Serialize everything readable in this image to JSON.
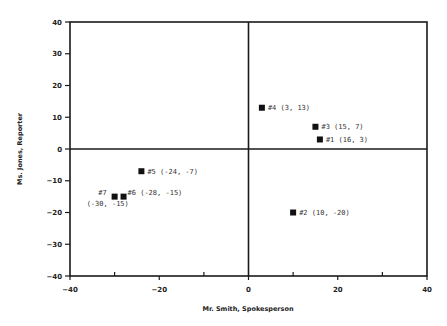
{
  "chart_data": {
    "type": "scatter",
    "title": "",
    "xlabel": "Mr. Smith, Spokesperson",
    "ylabel": "Ms. Jones, Reporter",
    "xlim": [
      -40,
      40
    ],
    "ylim": [
      -40,
      40
    ],
    "x_ticks": [
      -40,
      -20,
      0,
      20,
      40
    ],
    "y_ticks": [
      -40,
      -30,
      -20,
      -10,
      0,
      10,
      20,
      30,
      40
    ],
    "x_minor_ticks": [
      -30,
      -10,
      10,
      30
    ],
    "grid": false,
    "quadrant_axes": true,
    "legend": null,
    "points": [
      {
        "id": "#1",
        "x": 16,
        "y": 3,
        "label": "#1 (16, 3)"
      },
      {
        "id": "#2",
        "x": 10,
        "y": -20,
        "label": "#2 (10, -20)"
      },
      {
        "id": "#3",
        "x": 15,
        "y": 7,
        "label": "#3 (15, 7)"
      },
      {
        "id": "#4",
        "x": 3,
        "y": 13,
        "label": "#4 (3, 13)"
      },
      {
        "id": "#5",
        "x": -24,
        "y": -7,
        "label": "#5 (-24, -7)"
      },
      {
        "id": "#6",
        "x": -28,
        "y": -15,
        "label": "#6 (-28, -15)"
      },
      {
        "id": "#7",
        "x": -30,
        "y": -15,
        "label": "#7",
        "label_line2": "(-30, -15)"
      }
    ]
  },
  "labels": {
    "xlabel": "Mr. Smith, Spokesperson",
    "ylabel": "Ms. Jones, Reporter"
  }
}
